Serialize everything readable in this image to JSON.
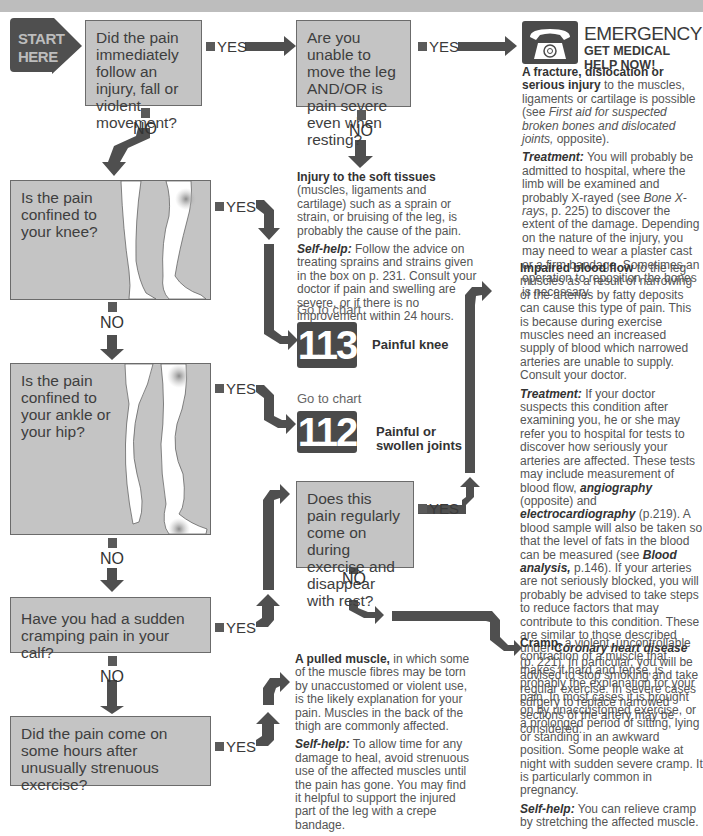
{
  "start": {
    "label_line1": "START",
    "label_line2": "HERE"
  },
  "labels": {
    "yes": "YES",
    "no": "NO",
    "go_to_chart": "Go to chart"
  },
  "questions": {
    "q1": "Did the pain immediately follow an injury, fall or violent movement?",
    "q2": "Are you unable to move the leg AND/OR is pain severe even when resting?",
    "q3": "Is the pain confined to your knee?",
    "q4": "Is the pain confined to your ankle or your hip?",
    "q5": "Does this pain regularly come on during exercise and disappear with rest?",
    "q6": "Have you had a sudden cramping pain in your calf?",
    "q7": "Did the pain come on some hours after unusually strenuous exercise?"
  },
  "emergency": {
    "icon": "telephone-icon",
    "title": "EMERGENCY",
    "subtitle_line1": "GET MEDICAL",
    "subtitle_line2": "HELP NOW!",
    "heading": "A fracture, dislocation or serious injury",
    "body": " to the muscles, ligaments or cartilage is possible (see ",
    "ref": "First aid for suspected broken bones and dislocated joints,",
    "body_end": " opposite).",
    "treatment_label": "Treatment:",
    "treatment_a": " You will probably be admitted to hospital, where the limb will be examined and probably X-rayed (see ",
    "treatment_ref": "Bone X-rays",
    "treatment_b": ", p. 225) to discover the extent of the damage. Depending on the nature of the injury, you may need to wear a plaster cast or a firm bandage. Sometimes an operation to reposition the bones is necessary."
  },
  "soft_tissue": {
    "heading": "Injury to the soft tissues",
    "body": " (muscles, ligaments and cartilage) such as a sprain or strain, or bruising of the leg, is probably the cause of the pain.",
    "selfhelp_label": "Self-help:",
    "selfhelp": " Follow the advice on treating sprains and strains given in the box on p. 231. Consult your doctor if pain and swelling are severe, or if there is no improvement within 24 hours."
  },
  "charts": [
    {
      "number": "113",
      "name": "Painful knee"
    },
    {
      "number": "112",
      "name": "Painful or swollen joints"
    }
  ],
  "blood_flow": {
    "heading": "Impaired blood flow",
    "body": " to the leg muscles as a result of narrowing of the arteries by fatty deposits can cause this type of pain. This is because during exercise muscles need an increased supply of blood which narrowed arteries are unable to supply. Consult your doctor.",
    "treatment_label": "Treatment:",
    "t1": " If your doctor suspects this condition after examining you, he or she may refer you to hospital for tests to discover how seriously your arteries are affected. These tests may include measurement of blood flow, ",
    "r1": "angiography",
    "t2": " (opposite) and ",
    "r2": "electrocardiography",
    "t3": " (p.219). A blood sample will also be taken so that the level of fats in the blood can be measured (see ",
    "r3": "Blood analysis,",
    "t4": " p.146). If your arteries are not seriously blocked, you will probably be advised to take steps to reduce factors that may contribute to this condition. These are similar to those described under ",
    "r4": "Coronary heart disease",
    "t5": " (p. 221). In particular, you will be advised to stop smoking and take regular exercise. In severe cases surgery to replace narrowed sections of the artery may be considered."
  },
  "cramp": {
    "heading": "Cramp,",
    "body": " a violent, uncontrollable contraction of a muscle that makes it hard and tense, is probably the explanation for your pain. In most cases it is brought on by unaccustomed exercise, or a prolonged period of sitting, lying or standing in an awkward position. Some people wake at night with sudden severe cramp. It is particularly common in pregnancy.",
    "selfhelp_label": "Self-help:",
    "selfhelp": " You can relieve cramp by stretching the affected muscle."
  },
  "pulled_muscle": {
    "heading": "A pulled muscle,",
    "body": " in which some of the muscle fibres may be torn by unaccustomed or violent use, is the likely explanation for your pain. Muscles in the back of the thigh are commonly affected.",
    "selfhelp_label": "Self-help:",
    "selfhelp": " To allow time for any damage to heal, avoid strenuous use of the affected muscles until the pain has gone. You may find it helpful to support the injured part of the leg with a crepe bandage."
  },
  "colors": {
    "box": "#c4c4c4",
    "arrow": "#4f4f4f",
    "text": "#555555",
    "topbar": "#bdbdbd"
  }
}
